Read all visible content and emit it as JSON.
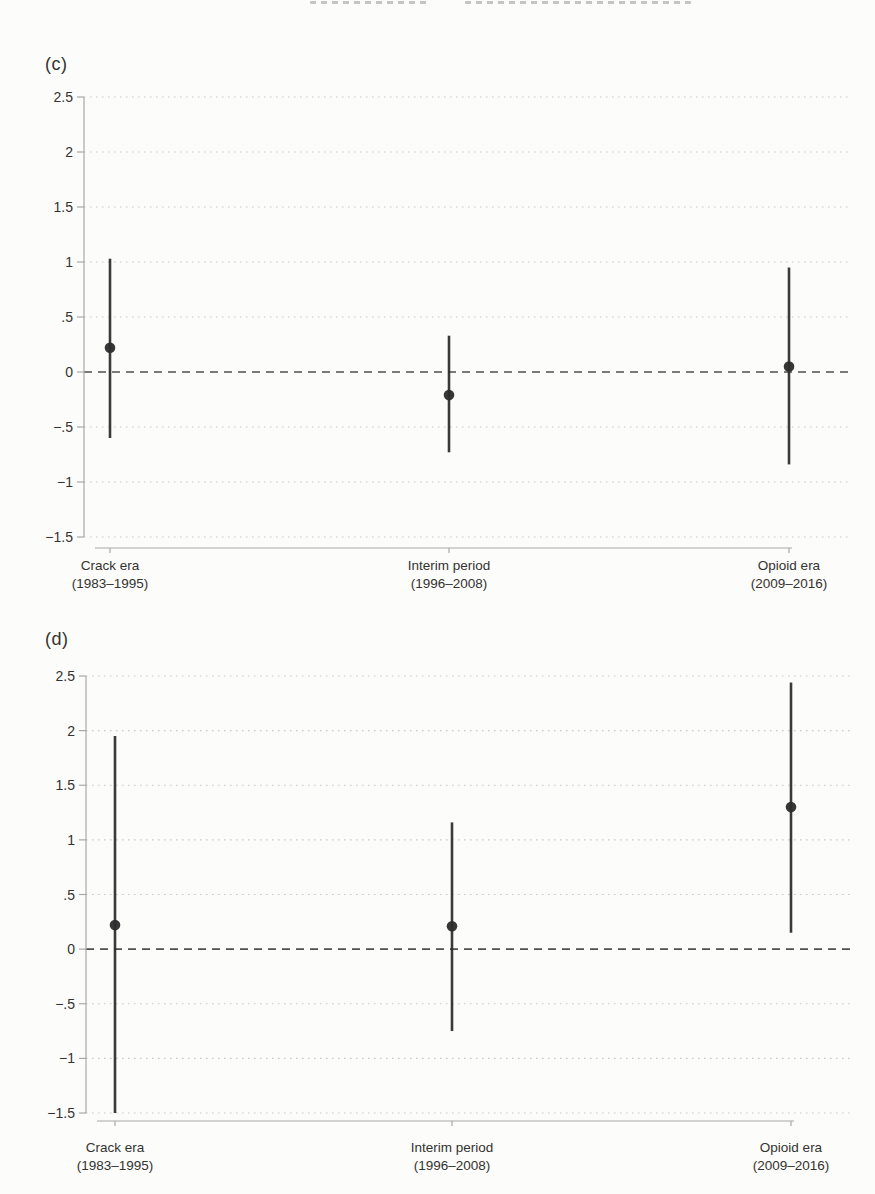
{
  "page": {
    "colors": {
      "paper": "#fcfcfa",
      "ink": "#2c2c2c",
      "axis": "#a8a8a4",
      "grid": "#bfbfba",
      "zero_line": "#4f4f4f",
      "text": "#333330"
    }
  },
  "chart_data": [
    {
      "type": "scatter",
      "subtype": "coefficient-plot-with-95ci",
      "panel_label": "(c)",
      "title": "",
      "xlabel": "",
      "ylabel": "",
      "ylim": [
        -1.5,
        2.5
      ],
      "yticks": [
        2.5,
        2,
        1.5,
        1,
        0.5,
        0,
        -0.5,
        -1,
        -1.5
      ],
      "ytick_labels": [
        "2.5",
        "2",
        "1.5",
        "1",
        ".5",
        "0",
        "−.5",
        "−1",
        "−1.5"
      ],
      "grid": "dotted-horizontal",
      "zero_line": "dashed",
      "legend": "none",
      "categories": [
        {
          "label": "Crack era",
          "sublabel": "(1983–1995)"
        },
        {
          "label": "Interim period",
          "sublabel": "(1996–2008)"
        },
        {
          "label": "Opioid era",
          "sublabel": "(2009–2016)"
        }
      ],
      "points": [
        {
          "estimate": 0.22,
          "ci_low": -0.6,
          "ci_high": 1.03
        },
        {
          "estimate": -0.21,
          "ci_low": -0.73,
          "ci_high": 0.33
        },
        {
          "estimate": 0.05,
          "ci_low": -0.84,
          "ci_high": 0.95
        }
      ]
    },
    {
      "type": "scatter",
      "subtype": "coefficient-plot-with-95ci",
      "panel_label": "(d)",
      "title": "",
      "xlabel": "",
      "ylabel": "",
      "ylim": [
        -1.5,
        2.5
      ],
      "yticks": [
        2.5,
        2,
        1.5,
        1,
        0.5,
        0,
        -0.5,
        -1,
        -1.5
      ],
      "ytick_labels": [
        "2.5",
        "2",
        "1.5",
        "1",
        ".5",
        "0",
        "−.5",
        "−1",
        "−1.5"
      ],
      "grid": "dotted-horizontal",
      "zero_line": "dashed",
      "legend": "none",
      "categories": [
        {
          "label": "Crack era",
          "sublabel": "(1983–1995)"
        },
        {
          "label": "Interim period",
          "sublabel": "(1996–2008)"
        },
        {
          "label": "Opioid era",
          "sublabel": "(2009–2016)"
        }
      ],
      "points": [
        {
          "estimate": 0.22,
          "ci_low": -1.5,
          "ci_high": 1.95
        },
        {
          "estimate": 0.21,
          "ci_low": -0.75,
          "ci_high": 1.16
        },
        {
          "estimate": 1.3,
          "ci_low": 0.15,
          "ci_high": 2.44
        }
      ]
    }
  ]
}
